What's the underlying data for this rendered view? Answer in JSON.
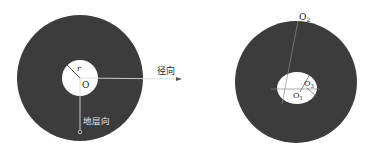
{
  "left_diagram": {
    "radius_label": "r",
    "center_label": "O",
    "radial_direction_label": "径向",
    "vertical_direction_label": "地层向"
  },
  "right_diagram": {
    "top_label_main": "O",
    "top_label_sub": "2",
    "center_label_main": "O",
    "center_label_sub": "1",
    "offset_label_main": "O",
    "offset_label_sub": "3"
  },
  "colors": {
    "ring": "#3c3c3c",
    "hole": "#ffffff",
    "line": "#d8d8d8",
    "background": "#ffffff"
  }
}
